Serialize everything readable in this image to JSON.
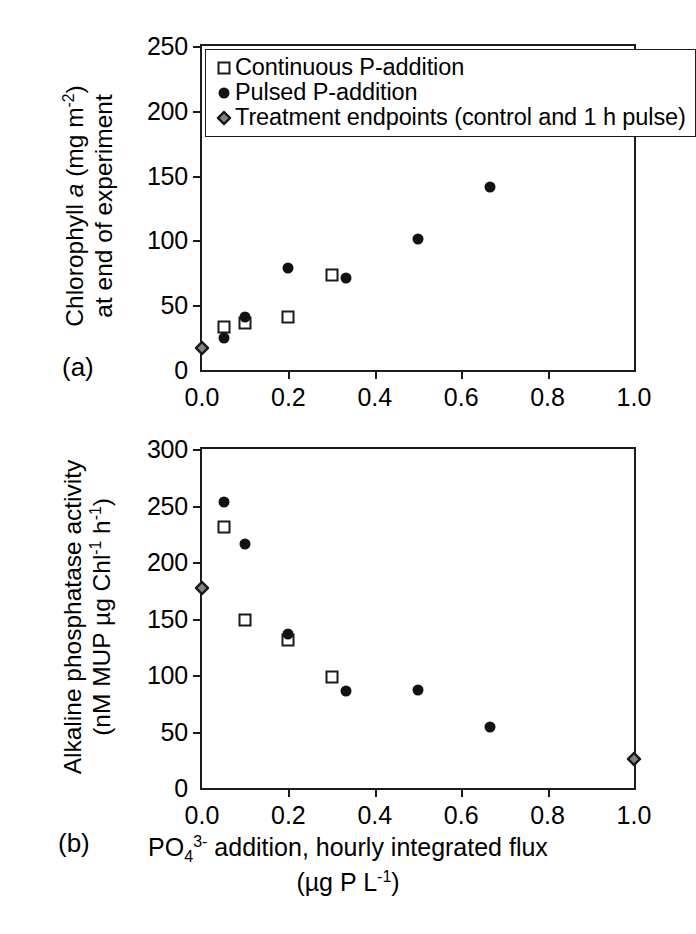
{
  "figure": {
    "panel_a_tag": "(a)",
    "panel_b_tag": "(b)"
  },
  "legend": {
    "items": [
      {
        "symbol": "open-square",
        "label": "Continuous P-addition"
      },
      {
        "symbol": "filled-circle",
        "label": "Pulsed P-addition"
      },
      {
        "symbol": "diamond",
        "label": "Treatment endpoints (control and 1 h pulse)"
      }
    ]
  },
  "axis": {
    "x_title_line1_pre": "PO",
    "x_title_line1_sub": "4",
    "x_title_line1_sup": "3-",
    "x_title_line1_post": " addition, hourly integrated flux",
    "x_title_line2_pre": "(µg P L",
    "x_title_line2_sup": "-1",
    "x_title_line2_post": ")",
    "y_title_a_line1_pre": "Chlorophyll ",
    "y_title_a_line1_ital": "a",
    "y_title_a_line1_mid": " (mg m",
    "y_title_a_line1_sup": "-2",
    "y_title_a_line1_post": ")",
    "y_title_a_line2": "at end of experiment",
    "y_title_b_line1": "Alkaline phosphatase activity",
    "y_title_b_line2_pre": "(nM MUP µg Chl",
    "y_title_b_line2_sup1": "-1",
    "y_title_b_line2_mid": " h",
    "y_title_b_line2_sup2": "-1",
    "y_title_b_line2_post": ")"
  },
  "chart_data": [
    {
      "type": "scatter",
      "panel": "(a)",
      "title": "",
      "xlabel": "PO4 3- addition, hourly integrated flux (µg P L-1)",
      "ylabel": "Chlorophyll a (mg m-2) at end of experiment",
      "xlim": [
        0.0,
        1.0
      ],
      "ylim": [
        0,
        250
      ],
      "xticks": [
        0.0,
        0.2,
        0.4,
        0.6,
        0.8,
        1.0
      ],
      "xticklabels": [
        "0.0",
        "0.2",
        "0.4",
        "0.6",
        "0.8",
        "1.0"
      ],
      "yticks": [
        0,
        50,
        100,
        150,
        200,
        250
      ],
      "yticklabels": [
        "0",
        "50",
        "100",
        "150",
        "200",
        "250"
      ],
      "grid": false,
      "legend_position": "top-left-inside",
      "series": [
        {
          "name": "Continuous P-addition",
          "marker": "open-square",
          "points": [
            {
              "x": 0.05,
              "y": 33
            },
            {
              "x": 0.1,
              "y": 36
            },
            {
              "x": 0.2,
              "y": 41
            },
            {
              "x": 0.3,
              "y": 73
            }
          ]
        },
        {
          "name": "Pulsed P-addition",
          "marker": "filled-circle",
          "points": [
            {
              "x": 0.05,
              "y": 25
            },
            {
              "x": 0.1,
              "y": 41
            },
            {
              "x": 0.2,
              "y": 79
            },
            {
              "x": 0.333,
              "y": 71
            },
            {
              "x": 0.5,
              "y": 101
            },
            {
              "x": 0.667,
              "y": 141
            }
          ]
        },
        {
          "name": "Treatment endpoints (control and 1 h pulse)",
          "marker": "diamond",
          "points": [
            {
              "x": 0.0,
              "y": 17
            },
            {
              "x": 1.0,
              "y": 212
            }
          ]
        }
      ]
    },
    {
      "type": "scatter",
      "panel": "(b)",
      "title": "",
      "xlabel": "PO4 3- addition, hourly integrated flux (µg P L-1)",
      "ylabel": "Alkaline phosphatase activity (nM MUP µg Chl-1 h-1)",
      "xlim": [
        0.0,
        1.0
      ],
      "ylim": [
        0,
        300
      ],
      "xticks": [
        0.0,
        0.2,
        0.4,
        0.6,
        0.8,
        1.0
      ],
      "xticklabels": [
        "0.0",
        "0.2",
        "0.4",
        "0.6",
        "0.8",
        "1.0"
      ],
      "yticks": [
        0,
        50,
        100,
        150,
        200,
        250,
        300
      ],
      "yticklabels": [
        "0",
        "50",
        "100",
        "150",
        "200",
        "250",
        "300"
      ],
      "grid": false,
      "legend_position": "none",
      "series": [
        {
          "name": "Continuous P-addition",
          "marker": "open-square",
          "points": [
            {
              "x": 0.05,
              "y": 231
            },
            {
              "x": 0.1,
              "y": 149
            },
            {
              "x": 0.2,
              "y": 131
            },
            {
              "x": 0.3,
              "y": 98
            }
          ]
        },
        {
          "name": "Pulsed P-addition",
          "marker": "filled-circle",
          "points": [
            {
              "x": 0.05,
              "y": 253
            },
            {
              "x": 0.1,
              "y": 216
            },
            {
              "x": 0.2,
              "y": 136
            },
            {
              "x": 0.333,
              "y": 86
            },
            {
              "x": 0.5,
              "y": 87
            },
            {
              "x": 0.667,
              "y": 54
            }
          ]
        },
        {
          "name": "Treatment endpoints (control and 1 h pulse)",
          "marker": "diamond",
          "points": [
            {
              "x": 0.0,
              "y": 177
            },
            {
              "x": 1.0,
              "y": 26
            }
          ]
        }
      ]
    }
  ],
  "colors": {
    "ink": "#1b1b1b",
    "marker_fill": "#121212",
    "background": "#ffffff"
  }
}
